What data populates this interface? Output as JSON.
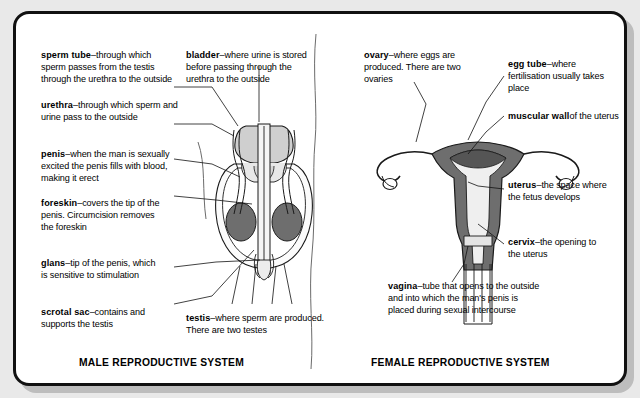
{
  "page": {
    "background_color": "#e9e9e9",
    "card_background": "#ffffff",
    "border_color": "#111111"
  },
  "male": {
    "caption": "MALE REPRODUCTIVE SYSTEM",
    "labels": [
      {
        "id": "sperm-tube",
        "term": "sperm tube",
        "dash": "–",
        "description": "through which sperm passes from the testis through the urethra to the outside"
      },
      {
        "id": "urethra",
        "term": "urethra",
        "dash": "–",
        "description": "through which sperm and urine pass to the outside"
      },
      {
        "id": "penis",
        "term": "penis",
        "dash": "–",
        "description": "when the man is sexually excited the penis fills with blood, making it erect"
      },
      {
        "id": "foreskin",
        "term": "foreskin",
        "dash": "–",
        "description": "covers the tip of the penis. Circumcision removes the foreskin"
      },
      {
        "id": "glans",
        "term": "glans",
        "dash": "–",
        "description": "tip of the penis, which is sensitive to stimulation"
      },
      {
        "id": "scrotal-sac",
        "term": "scrotal sac",
        "dash": "–",
        "description": "contains and supports the testis"
      },
      {
        "id": "bladder",
        "term": "bladder",
        "dash": "–",
        "description": "where urine is stored before passing through the urethra to the outside"
      },
      {
        "id": "testis",
        "term": "testis",
        "dash": "–",
        "description": "where sperm are produced. There are two testes"
      }
    ]
  },
  "female": {
    "caption": "FEMALE REPRODUCTIVE SYSTEM",
    "labels": [
      {
        "id": "ovary",
        "term": "ovary",
        "dash": "–",
        "description": "where eggs are produced. There are two ovaries"
      },
      {
        "id": "egg-tube",
        "term": "egg tube",
        "dash": "–",
        "description": "where fertilisation usually takes place"
      },
      {
        "id": "muscular-wall",
        "term": "muscular wall",
        "dash": "",
        "description": "of the uterus"
      },
      {
        "id": "uterus",
        "term": "uterus",
        "dash": "–",
        "description": "the space where the fetus develops"
      },
      {
        "id": "cervix",
        "term": "cervix",
        "dash": "–",
        "description": "the opening to the uterus"
      },
      {
        "id": "vagina",
        "term": "vagina",
        "dash": "–",
        "description": "tube that opens to the outside and into which the man's penis is placed during sexual intercourse"
      }
    ]
  },
  "art": {
    "organ_fill_dark": "#6e6e6e",
    "organ_fill_light": "#d2d2d2",
    "organ_fill_pale": "#efefef",
    "outline": "#1a1a1a"
  }
}
